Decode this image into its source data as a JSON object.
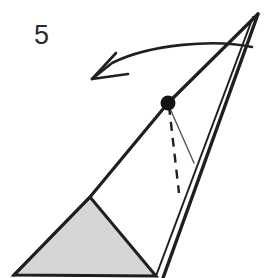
{
  "figure": {
    "label": "5",
    "label_x": 34,
    "label_y": 44,
    "background_color": "#ffffff",
    "stroke_color": "#1f1f1f",
    "shaded_fill_color": "#d6d6d6",
    "thin_line_color": "#555555",
    "title": "Figure 5 — rotating triangle diagram",
    "parts": {
      "shaded_triangle_name": "shaded-triangle",
      "outline_triangle_name": "outline-triangle",
      "pivot_dot_name": "pivot-point-dot",
      "dashed_segment_name": "dashed-segment",
      "thin_segment_name": "thin-segment",
      "rotation_arrow_name": "rotation-arrow"
    },
    "geometry": {
      "apex_top": [
        258,
        14
      ],
      "pivot": [
        168,
        103
      ],
      "shaded_apex": [
        90,
        197
      ],
      "bottom_left": [
        14,
        275
      ],
      "bottom_mid": [
        156,
        276
      ],
      "bottom_right": [
        166,
        278
      ],
      "dashed_end": [
        178,
        192
      ],
      "thin_end": [
        194,
        163
      ],
      "arrow_tip": [
        92,
        80
      ],
      "arrow_tail": [
        252,
        47
      ]
    }
  }
}
